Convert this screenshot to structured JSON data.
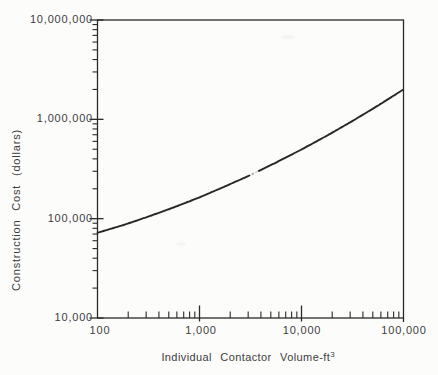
{
  "figure": {
    "background": "#fcfcfb",
    "line_color": "#2a2a2a",
    "curve_color": "#262626",
    "text_color": "#3d3d3d",
    "artifact_gray": "#bdbdbd"
  },
  "chart_data": {
    "type": "line",
    "title": "",
    "xlabel": "Individual Contactor Volume-ft",
    "xlabel_exponent": "3",
    "ylabel": "Construction Cost (dollars)",
    "x_scale": "log",
    "y_scale": "log",
    "xlim": [
      100,
      100000
    ],
    "ylim": [
      10000,
      10000000
    ],
    "x_tick_labels": [
      "100",
      "1,000",
      "10,000",
      "100,000"
    ],
    "y_tick_labels": [
      "10,000",
      "100,000",
      "1,000,000",
      "10,000,000"
    ],
    "grid": false,
    "legend": false,
    "series": [
      {
        "name": "construction-cost-curve",
        "x": [
          100,
          178,
          316,
          562,
          1000,
          1778,
          3162,
          5623,
          10000,
          17783,
          31623,
          56234,
          100000
        ],
        "y": [
          72000,
          86000,
          105000,
          130000,
          164000,
          211000,
          275000,
          367000,
          497000,
          685000,
          962000,
          1375000,
          2000000
        ]
      }
    ]
  }
}
